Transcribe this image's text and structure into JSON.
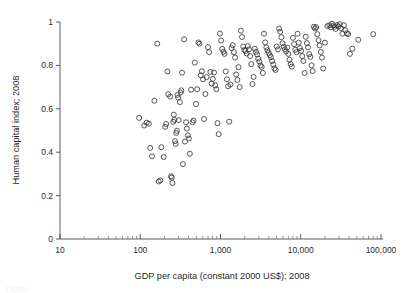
{
  "figure": {
    "background_color": "#ffffff",
    "point_color": "#3a3a3a",
    "axis_color": "#4a4a4a",
    "caption_ghost": "Figure"
  },
  "chart_data": {
    "type": "scatter",
    "title": "",
    "xlabel": "GDP per capita (constant 2000 US$); 2008",
    "ylabel": "Human capital index; 2008",
    "xscale": "log",
    "yscale": "linear",
    "xlim": [
      10,
      100000
    ],
    "ylim": [
      0,
      1
    ],
    "xtick_labels": [
      "10",
      "100",
      "1,000",
      "10,000",
      "100,000"
    ],
    "xtick_values": [
      10,
      100,
      1000,
      10000,
      100000
    ],
    "ytick_labels": [
      "0",
      "0.2",
      "0.4",
      "0.6",
      "0.8",
      "1"
    ],
    "ytick_values": [
      0,
      0.2,
      0.4,
      0.6,
      0.8,
      1
    ],
    "grid": false,
    "legend": null,
    "marker": "open-circle",
    "marker_size_px": 5,
    "n_points": 173,
    "series": [
      {
        "name": "countries",
        "points": [
          [
            97,
            0.558
          ],
          [
            112,
            0.523
          ],
          [
            120,
            0.536
          ],
          [
            128,
            0.531
          ],
          [
            133,
            0.42
          ],
          [
            140,
            0.381
          ],
          [
            150,
            0.637
          ],
          [
            163,
            0.9
          ],
          [
            170,
            0.265
          ],
          [
            178,
            0.27
          ],
          [
            183,
            0.423
          ],
          [
            196,
            0.378
          ],
          [
            205,
            0.517
          ],
          [
            210,
            0.53
          ],
          [
            218,
            0.772
          ],
          [
            223,
            0.667
          ],
          [
            236,
            0.656
          ],
          [
            242,
            0.289
          ],
          [
            247,
            0.283
          ],
          [
            252,
            0.258
          ],
          [
            258,
            0.54
          ],
          [
            262,
            0.573
          ],
          [
            266,
            0.549
          ],
          [
            271,
            0.451
          ],
          [
            276,
            0.438
          ],
          [
            281,
            0.489
          ],
          [
            286,
            0.499
          ],
          [
            291,
            0.664
          ],
          [
            296,
            0.651
          ],
          [
            301,
            0.548
          ],
          [
            312,
            0.631
          ],
          [
            318,
            0.675
          ],
          [
            325,
            0.685
          ],
          [
            332,
            0.766
          ],
          [
            340,
            0.345
          ],
          [
            352,
            0.92
          ],
          [
            361,
            0.449
          ],
          [
            372,
            0.538
          ],
          [
            381,
            0.509
          ],
          [
            392,
            0.478
          ],
          [
            404,
            0.463
          ],
          [
            415,
            0.393
          ],
          [
            430,
            0.688
          ],
          [
            447,
            0.538
          ],
          [
            462,
            0.546
          ],
          [
            478,
            0.813
          ],
          [
            495,
            0.622
          ],
          [
            512,
            0.69
          ],
          [
            530,
            0.906
          ],
          [
            548,
            0.9
          ],
          [
            567,
            0.754
          ],
          [
            586,
            0.773
          ],
          [
            605,
            0.736
          ],
          [
            625,
            0.553
          ],
          [
            648,
            0.668
          ],
          [
            672,
            0.746
          ],
          [
            698,
            0.884
          ],
          [
            722,
            0.861
          ],
          [
            748,
            0.77
          ],
          [
            775,
            0.716
          ],
          [
            802,
            0.738
          ],
          [
            830,
            0.767
          ],
          [
            858,
            0.708
          ],
          [
            888,
            0.69
          ],
          [
            918,
            0.534
          ],
          [
            950,
            0.483
          ],
          [
            983,
            0.947
          ],
          [
            1018,
            0.915
          ],
          [
            1052,
            0.876
          ],
          [
            1088,
            0.863
          ],
          [
            1125,
            0.853
          ],
          [
            1163,
            0.772
          ],
          [
            1202,
            0.736
          ],
          [
            1243,
            0.704
          ],
          [
            1285,
            0.541
          ],
          [
            1329,
            0.712
          ],
          [
            1374,
            0.88
          ],
          [
            1420,
            0.893
          ],
          [
            1468,
            0.861
          ],
          [
            1518,
            0.836
          ],
          [
            1569,
            0.758
          ],
          [
            1622,
            0.733
          ],
          [
            1677,
            0.792
          ],
          [
            1734,
            0.7
          ],
          [
            1793,
            0.96
          ],
          [
            1853,
            0.931
          ],
          [
            1916,
            0.887
          ],
          [
            1981,
            0.871
          ],
          [
            2048,
            0.866
          ],
          [
            2117,
            0.855
          ],
          [
            2188,
            0.889
          ],
          [
            2262,
            0.874
          ],
          [
            2339,
            0.843
          ],
          [
            2418,
            0.806
          ],
          [
            2500,
            0.714
          ],
          [
            2584,
            0.747
          ],
          [
            2672,
            0.877
          ],
          [
            2762,
            0.862
          ],
          [
            2855,
            0.85
          ],
          [
            2952,
            0.831
          ],
          [
            3051,
            0.818
          ],
          [
            3154,
            0.8
          ],
          [
            3261,
            0.793
          ],
          [
            3371,
            0.765
          ],
          [
            3485,
            0.946
          ],
          [
            3603,
            0.906
          ],
          [
            3725,
            0.883
          ],
          [
            3850,
            0.87
          ],
          [
            3980,
            0.858
          ],
          [
            4115,
            0.847
          ],
          [
            4254,
            0.838
          ],
          [
            4397,
            0.82
          ],
          [
            4546,
            0.804
          ],
          [
            4700,
            0.786
          ],
          [
            4859,
            0.779
          ],
          [
            5023,
            0.887
          ],
          [
            5193,
            0.874
          ],
          [
            5368,
            0.97
          ],
          [
            5550,
            0.955
          ],
          [
            5737,
            0.93
          ],
          [
            5931,
            0.902
          ],
          [
            6132,
            0.886
          ],
          [
            6339,
            0.874
          ],
          [
            6553,
            0.864
          ],
          [
            6775,
            0.882
          ],
          [
            7004,
            0.853
          ],
          [
            7241,
            0.826
          ],
          [
            7486,
            0.806
          ],
          [
            7739,
            0.794
          ],
          [
            8000,
            0.927
          ],
          [
            8270,
            0.898
          ],
          [
            8550,
            0.872
          ],
          [
            8839,
            0.861
          ],
          [
            9138,
            0.946
          ],
          [
            9447,
            0.905
          ],
          [
            9766,
            0.88
          ],
          [
            10096,
            0.867
          ],
          [
            10438,
            0.843
          ],
          [
            10791,
            0.82
          ],
          [
            11156,
            0.765
          ],
          [
            11533,
            0.932
          ],
          [
            11923,
            0.903
          ],
          [
            12326,
            0.883
          ],
          [
            12743,
            0.852
          ],
          [
            13174,
            0.839
          ],
          [
            13620,
            0.8
          ],
          [
            14081,
            0.774
          ],
          [
            14557,
            0.978
          ],
          [
            15049,
            0.97
          ],
          [
            15558,
            0.976
          ],
          [
            16084,
            0.944
          ],
          [
            16628,
            0.916
          ],
          [
            17190,
            0.892
          ],
          [
            17771,
            0.862
          ],
          [
            18372,
            0.836
          ],
          [
            18993,
            0.786
          ],
          [
            20000,
            0.905
          ],
          [
            21500,
            0.981
          ],
          [
            22700,
            0.985
          ],
          [
            23600,
            0.975
          ],
          [
            24500,
            0.992
          ],
          [
            25400,
            0.984
          ],
          [
            26300,
            0.978
          ],
          [
            27200,
            0.968
          ],
          [
            28300,
            0.986
          ],
          [
            29400,
            0.979
          ],
          [
            30500,
            0.99
          ],
          [
            31600,
            0.972
          ],
          [
            33000,
            0.946
          ],
          [
            34500,
            0.985
          ],
          [
            36000,
            0.962
          ],
          [
            37500,
            0.948
          ],
          [
            39000,
            0.944
          ],
          [
            41000,
            0.853
          ],
          [
            44000,
            0.877
          ],
          [
            52000,
            0.918
          ],
          [
            80000,
            0.944
          ]
        ]
      }
    ]
  }
}
